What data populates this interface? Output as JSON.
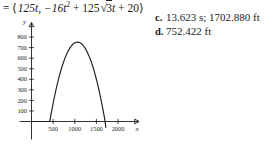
{
  "equation": {
    "lead": ") =",
    "open_bracket": "⟨",
    "term_x": "125t,",
    "term_y_a": "−16t",
    "term_y_a_exp": "2",
    "plus": "+",
    "coef": "125",
    "radicand": "3",
    "term_y_b": "t",
    "plus2": "+",
    "constant": "20",
    "close_bracket": "⟩",
    "full_text": ") = ⟨125t, −16t² + 125√3t + 20⟩"
  },
  "choices": [
    {
      "letter": "c.",
      "text": "13.623 s; 1702.880 ft"
    },
    {
      "letter": "d.",
      "text": "752.422 ft"
    }
  ],
  "chart_data": {
    "type": "line",
    "title": "",
    "xlabel": "x",
    "ylabel": "y",
    "xlim": [
      0,
      2300
    ],
    "ylim": [
      0,
      900
    ],
    "xticks": [
      500,
      1000,
      1500,
      2000
    ],
    "xtick_labels": [
      "500",
      "1000",
      "1500",
      "2000"
    ],
    "yticks": [
      100,
      200,
      300,
      400,
      500,
      600,
      700,
      800
    ],
    "ytick_labels": [
      "100",
      "200",
      "300",
      "400",
      "500",
      "600",
      "700",
      "800"
    ],
    "grid": false,
    "legend": null,
    "series": [
      {
        "name": "projectile-path",
        "x": [
          0,
          85,
          170,
          255,
          340,
          425,
          511,
          596,
          681,
          766,
          851,
          936,
          1021,
          1106,
          1191,
          1277,
          1362,
          1447,
          1532,
          1617,
          1702
        ],
        "y": [
          20,
          165,
          303,
          433,
          556,
          672,
          780,
          881,
          974,
          1060,
          1139,
          1138,
          1072,
          1000,
          920,
          833,
          739,
          638,
          529,
          413,
          290
        ]
      }
    ],
    "curve_points": [
      {
        "x": 0,
        "y": 20
      },
      {
        "x": 200,
        "y": 254
      },
      {
        "x": 400,
        "y": 444
      },
      {
        "x": 600,
        "y": 590
      },
      {
        "x": 850,
        "y": 714
      },
      {
        "x": 1062,
        "y": 752
      },
      {
        "x": 1300,
        "y": 700
      },
      {
        "x": 1500,
        "y": 580
      },
      {
        "x": 1620,
        "y": 440
      },
      {
        "x": 1702,
        "y": 0
      }
    ],
    "apex": {
      "x": 1062,
      "y": 752
    },
    "x_intercept": 1702
  }
}
